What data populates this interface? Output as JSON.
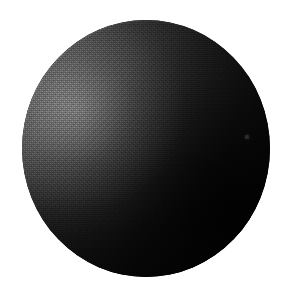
{
  "image": {
    "subject": "dark sphere",
    "description": "A single large dark gray-to-black sphere centered on a plain white background, lit softly from the upper left, rendered with a fine halftone dither grain typical of a scanned printed photograph.",
    "width": 294,
    "height": 300,
    "background_color": "#ffffff"
  },
  "sphere": {
    "label": "sphere",
    "center_x": 146,
    "center_y": 148,
    "width": 248,
    "height": 257,
    "bounds": {
      "left": 22,
      "top": 20,
      "right": 270,
      "bottom": 277
    },
    "base_color": "#070707",
    "highlight_color": "#6e6e6e",
    "midtone_color": "#3f3f3f",
    "shadow_color": "#040404",
    "light_direction": "upper-left",
    "highlight_x": 60,
    "highlight_y": 105,
    "texture": "halftone-dither-grain"
  },
  "speck": {
    "label": "light speck",
    "x": 247,
    "y": 137,
    "color": "#969696"
  }
}
